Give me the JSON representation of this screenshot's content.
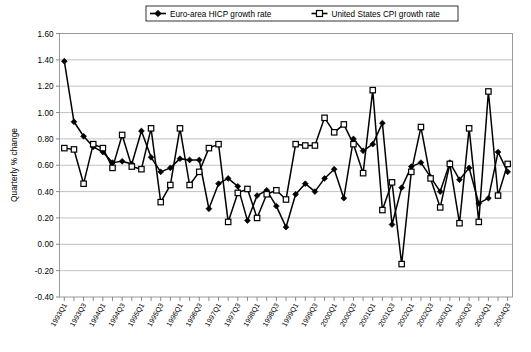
{
  "chart_data": {
    "type": "line",
    "title": "",
    "xlabel": "",
    "ylabel": "Quarterly % change",
    "ylim": [
      -0.4,
      1.6
    ],
    "ytick_step": 0.2,
    "yticks": [
      "1.60",
      "1.40",
      "1.20",
      "1.00",
      "0.80",
      "0.60",
      "0.40",
      "0.20",
      "0.00",
      "-0.20",
      "-0.40"
    ],
    "grid": true,
    "legend_position": "top-center",
    "x": [
      "1993Q1",
      "1993Q2",
      "1993Q3",
      "1993Q4",
      "1994Q1",
      "1994Q2",
      "1994Q3",
      "1994Q4",
      "1995Q1",
      "1995Q2",
      "1995Q3",
      "1995Q4",
      "1996Q1",
      "1996Q2",
      "1996Q3",
      "1996Q4",
      "1997Q1",
      "1997Q2",
      "1997Q3",
      "1997Q4",
      "1998Q1",
      "1998Q2",
      "1998Q3",
      "1998Q4",
      "1999Q1",
      "1999Q2",
      "1999Q3",
      "1999Q4",
      "2000Q1",
      "2000Q2",
      "2000Q3",
      "2000Q4",
      "2001Q1",
      "2001Q2",
      "2001Q3",
      "2001Q4",
      "2002Q1",
      "2002Q2",
      "2002Q3",
      "2002Q4",
      "2003Q1",
      "2003Q2",
      "2003Q3",
      "2003Q4",
      "2004Q1",
      "2004Q2",
      "2004Q3"
    ],
    "xtick_labels_shown": [
      "1993Q1",
      "1993Q3",
      "1994Q1",
      "1994Q3",
      "1995Q1",
      "1995Q3",
      "1996Q1",
      "1996Q3",
      "1997Q1",
      "1997Q3",
      "1998Q1",
      "1998Q3",
      "1999Q1",
      "1999Q3",
      "2000Q1",
      "2000Q3",
      "2001Q1",
      "2001Q3",
      "2002Q1",
      "2002Q3",
      "2003Q1",
      "2003Q3",
      "2004Q1",
      "2004Q3"
    ],
    "series": [
      {
        "name": "Euro-area HICP growth rate",
        "marker": "filled-diamond",
        "values": [
          1.39,
          0.93,
          0.82,
          0.74,
          0.7,
          0.62,
          0.63,
          0.61,
          0.86,
          0.66,
          0.55,
          0.58,
          0.65,
          0.64,
          0.64,
          0.27,
          0.46,
          0.5,
          0.44,
          0.18,
          0.37,
          0.41,
          0.29,
          0.13,
          0.38,
          0.46,
          0.4,
          0.5,
          0.57,
          0.35,
          0.8,
          0.71,
          0.76,
          0.92,
          0.15,
          0.43,
          0.59,
          0.62,
          0.51,
          0.4,
          0.62,
          0.49,
          0.58,
          0.31,
          0.35,
          0.7,
          0.55
        ]
      },
      {
        "name": "United States CPI growth rate",
        "marker": "open-square",
        "values": [
          0.73,
          0.72,
          0.46,
          0.76,
          0.73,
          0.58,
          0.83,
          0.59,
          0.57,
          0.88,
          0.32,
          0.45,
          0.88,
          0.45,
          0.55,
          0.73,
          0.76,
          0.17,
          0.39,
          0.42,
          0.2,
          0.38,
          0.41,
          0.34,
          0.76,
          0.75,
          0.75,
          0.96,
          0.85,
          0.91,
          0.76,
          0.54,
          1.17,
          0.26,
          0.47,
          -0.15,
          0.55,
          0.89,
          0.5,
          0.28,
          0.61,
          0.16,
          0.88,
          0.17,
          1.16,
          0.37,
          0.61
        ]
      }
    ]
  },
  "legend": {
    "items": [
      {
        "label": "Euro-area HICP growth rate",
        "marker": "filled-diamond"
      },
      {
        "label": "United States CPI growth rate",
        "marker": "open-square"
      }
    ]
  },
  "axes": {
    "y_title": "Quarterly % change"
  },
  "colors": {
    "line": "#000000",
    "grid": "#a8a8a8",
    "frame": "#9a9a9a",
    "background": "#ffffff"
  }
}
